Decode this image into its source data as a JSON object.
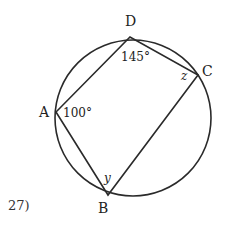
{
  "problem": {
    "number_label": "27)"
  },
  "diagram": {
    "type": "inscribed-quadrilateral",
    "circle": {
      "cx": 133,
      "cy": 118,
      "r": 78
    },
    "stroke_color": "#2a2a2a",
    "vertices": {
      "A": {
        "label": "A",
        "x": 56,
        "y": 112
      },
      "B": {
        "label": "B",
        "x": 108,
        "y": 195
      },
      "C": {
        "label": "C",
        "x": 198,
        "y": 75
      },
      "D": {
        "label": "D",
        "x": 130,
        "y": 37
      }
    },
    "sides": [
      "AB",
      "BC",
      "CD",
      "DA"
    ],
    "angles": {
      "A": "100°",
      "D": "145°",
      "C": "z",
      "B": "y"
    }
  }
}
